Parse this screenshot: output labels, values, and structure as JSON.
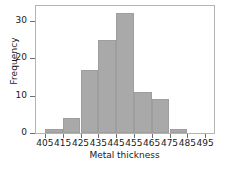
{
  "chart_data": {
    "type": "bar",
    "title": "",
    "xlabel": "Metal thickness",
    "ylabel": "Frequency",
    "bin_edges": [
      405,
      415,
      425,
      435,
      445,
      455,
      465,
      475,
      485,
      495
    ],
    "categories": [
      "405-415",
      "415-425",
      "425-435",
      "435-445",
      "445-455",
      "455-465",
      "465-475",
      "475-485",
      "485-495"
    ],
    "values": [
      1,
      4,
      17,
      25,
      32,
      11,
      9,
      1,
      0
    ],
    "bin_width": 10,
    "xlim": [
      400,
      500
    ],
    "ylim": [
      0,
      34
    ],
    "xticks": [
      405,
      415,
      425,
      435,
      445,
      455,
      465,
      475,
      485,
      495
    ],
    "xtick_labels": [
      "405",
      "415",
      "425",
      "435",
      "445",
      "455",
      "465",
      "475",
      "485",
      "495"
    ],
    "yticks": [
      0,
      10,
      20,
      30
    ],
    "ytick_labels": [
      "0",
      "10",
      "20",
      "30"
    ],
    "grid": false,
    "legend": null,
    "bar_color": "#a9a9a9",
    "bar_edge_color": "#9e9e9e",
    "axis_color": "#b4b4b4",
    "text_color": "#1a1a1a",
    "background_color": "#ffffff"
  }
}
